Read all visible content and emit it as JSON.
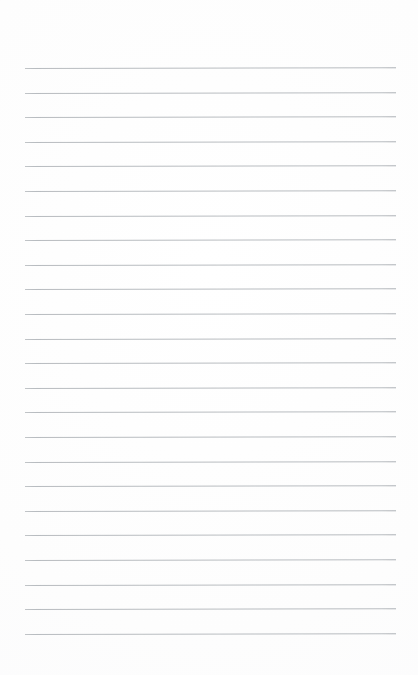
{
  "document": {
    "kind": "ruled-notebook-page",
    "title": "Blank ruled notebook page",
    "content_text": "",
    "page_width_px": 418,
    "page_height_px": 675,
    "background_color": "#fdfdfd",
    "is_blank": "true"
  },
  "ruling": {
    "line_color": "#b5b9bd",
    "line_thickness_px": 1,
    "line_count": 24,
    "first_line_y_px": 68,
    "last_line_y_px": 634,
    "line_spacing_px": 24.6,
    "line_start_x_px": 25,
    "line_end_x_px": 396,
    "line_length_px": 371,
    "skew_degrees": -0.12,
    "lines_y": [
      68,
      92.6,
      117.2,
      141.8,
      166.4,
      191,
      215.6,
      240.2,
      264.8,
      289.4,
      314,
      338.6,
      363.2,
      387.8,
      412.4,
      437,
      461.6,
      486.2,
      510.8,
      535.4,
      560,
      584.6,
      609.2,
      633.8
    ]
  },
  "margins": {
    "top_px": 68,
    "bottom_px": 41,
    "left_px": 25,
    "right_px": 22
  }
}
